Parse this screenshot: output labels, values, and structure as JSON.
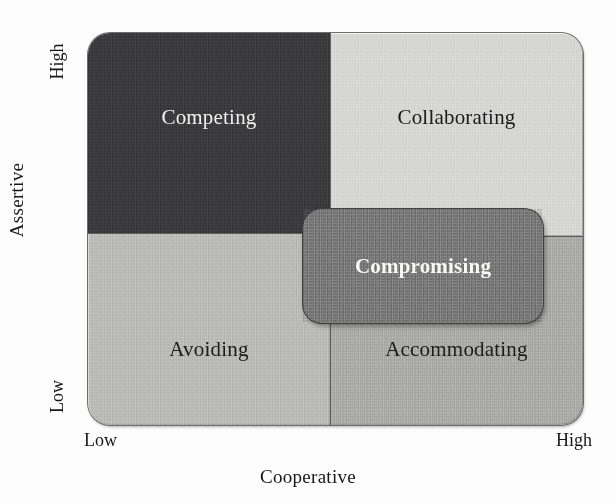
{
  "chart_data": {
    "type": "table",
    "xlabel": "Cooperative",
    "ylabel": "Assertive",
    "x_ticks": [
      "Low",
      "High"
    ],
    "y_ticks": [
      "Low",
      "High"
    ],
    "grid": false,
    "legend": "none",
    "cells": [
      {
        "label": "Competing",
        "assertive": "High",
        "cooperative": "Low",
        "position": "top-left",
        "fill": "#3b3b3d",
        "text_color": "#f3f3f1"
      },
      {
        "label": "Collaborating",
        "assertive": "High",
        "cooperative": "High",
        "position": "top-right",
        "fill": "#d9d9d7",
        "text_color": "#1b1b1d"
      },
      {
        "label": "Avoiding",
        "assertive": "Low",
        "cooperative": "Low",
        "position": "bottom-left",
        "fill": "#bdbdbb",
        "text_color": "#1b1b1d"
      },
      {
        "label": "Accommodating",
        "assertive": "Low",
        "cooperative": "High",
        "position": "bottom-right",
        "fill": "#adadab",
        "text_color": "#1b1b1d"
      },
      {
        "label": "Compromising",
        "assertive": "Medium",
        "cooperative": "Medium",
        "position": "center",
        "fill": "#7b7b7b",
        "text_color": "#fbfbf9"
      }
    ]
  },
  "axes": {
    "y": {
      "title": "Assertive",
      "high_label": "High",
      "low_label": "Low"
    },
    "x": {
      "title": "Cooperative",
      "low_label": "Low",
      "high_label": "High"
    }
  },
  "quadrants": {
    "top_left": {
      "label": "Competing"
    },
    "top_right": {
      "label": "Collaborating"
    },
    "bottom_left": {
      "label": "Avoiding"
    },
    "bottom_right": {
      "label": "Accommodating"
    },
    "center": {
      "label": "Compromising"
    }
  },
  "colors": {
    "competing": "#3b3b3d",
    "collaborating": "#d9d9d7",
    "avoiding": "#bdbdbb",
    "accommodating": "#adadab",
    "compromising": "#7b7b7b",
    "text_dark": "#1b1b1d",
    "text_light": "#f3f3f1",
    "page_background": "#ffffff"
  }
}
